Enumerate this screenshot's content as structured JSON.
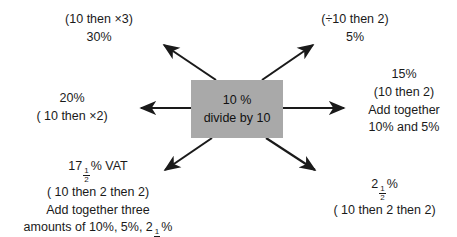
{
  "diagram": {
    "background_color": "#ffffff",
    "text_color": "#1a1a1a",
    "arrow_color": "#1a1a1a"
  },
  "center": {
    "name": "center-box",
    "fill_color": "#a9a9a9",
    "line1": "10 %",
    "line2": "divide by 10"
  },
  "branches": {
    "top_left": {
      "direction": "up-left",
      "method": "(10 then ×3)",
      "result": "30%"
    },
    "top_right": {
      "direction": "up-right",
      "method": "(÷10 then 2)",
      "result": "5%"
    },
    "left": {
      "direction": "left",
      "result": "20%",
      "method": "( 10 then ×2)"
    },
    "right": {
      "direction": "right",
      "result": "15%",
      "method": "(10 then 2)",
      "note_line1": "Add together",
      "note_line2": "10% and 5%"
    },
    "bottom_left": {
      "direction": "down-left",
      "result_prefix": "17",
      "result_fraction_numerator": "1",
      "result_fraction_denominator": "2",
      "result_suffix": "% VAT",
      "method": "( 10 then  2 then  2)",
      "note_line1": "Add together three",
      "note_line2_prefix": "amounts of 10%, 5%, 2",
      "note_line2_fraction_numerator": "1",
      "note_line2_fraction_denominator": "2",
      "note_line2_suffix": "%"
    },
    "bottom_right": {
      "direction": "down-right",
      "result_prefix": "2",
      "result_fraction_numerator": "1",
      "result_fraction_denominator": "2",
      "result_suffix": "%",
      "method": "( 10 then  2 then  2)"
    }
  }
}
